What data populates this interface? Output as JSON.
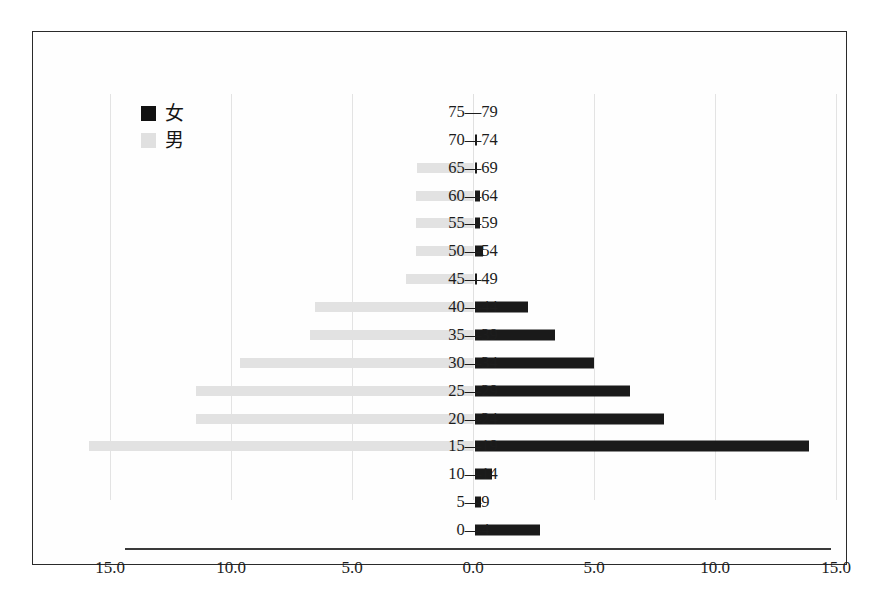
{
  "chart_data": {
    "type": "bar",
    "subtype": "population-pyramid",
    "title": "",
    "xlabel": "",
    "ylabel": "",
    "orientation": "horizontal",
    "categories": [
      "75—79",
      "70—74",
      "65—69",
      "60—64",
      "55—59",
      "50—54",
      "45—49",
      "40—44",
      "35—39",
      "30—34",
      "25—29",
      "20—24",
      "15—19",
      "10—14",
      "5—9",
      "0—4"
    ],
    "series": [
      {
        "name": "女",
        "side": "right",
        "color": "#1a1a1a",
        "values": [
          0.0,
          0.1,
          0.1,
          0.2,
          0.2,
          0.35,
          0.1,
          2.2,
          3.3,
          4.9,
          6.4,
          7.8,
          13.8,
          0.7,
          0.25,
          2.7
        ]
      },
      {
        "name": "男",
        "side": "left",
        "color": "#e2e2e2",
        "values": [
          0.0,
          0.0,
          0.15,
          0.2,
          0.2,
          0.2,
          0.6,
          4.4,
          4.6,
          7.5,
          9.3,
          9.3,
          13.7,
          0.0,
          0.0,
          0.0
        ]
      }
    ],
    "xticks": [
      "15.0",
      "10.0",
      "5.0",
      "0.0",
      "5.0",
      "10.0",
      "15.0"
    ],
    "xtick_values": [
      -15,
      -10,
      -5,
      0,
      5,
      10,
      15
    ],
    "xlim": [
      -15,
      15
    ],
    "grid": true,
    "legend_position": "upper-left"
  },
  "legend": {
    "items": [
      {
        "label": "女",
        "swatch": "female"
      },
      {
        "label": "男",
        "swatch": "male"
      }
    ]
  },
  "colors": {
    "female": "#1a1a1a",
    "male": "#e2e2e2",
    "axis": "#3a3a3a",
    "grid": "#e3e3e3",
    "frame": "#2a2a2a",
    "text": "#1d1d1d"
  }
}
